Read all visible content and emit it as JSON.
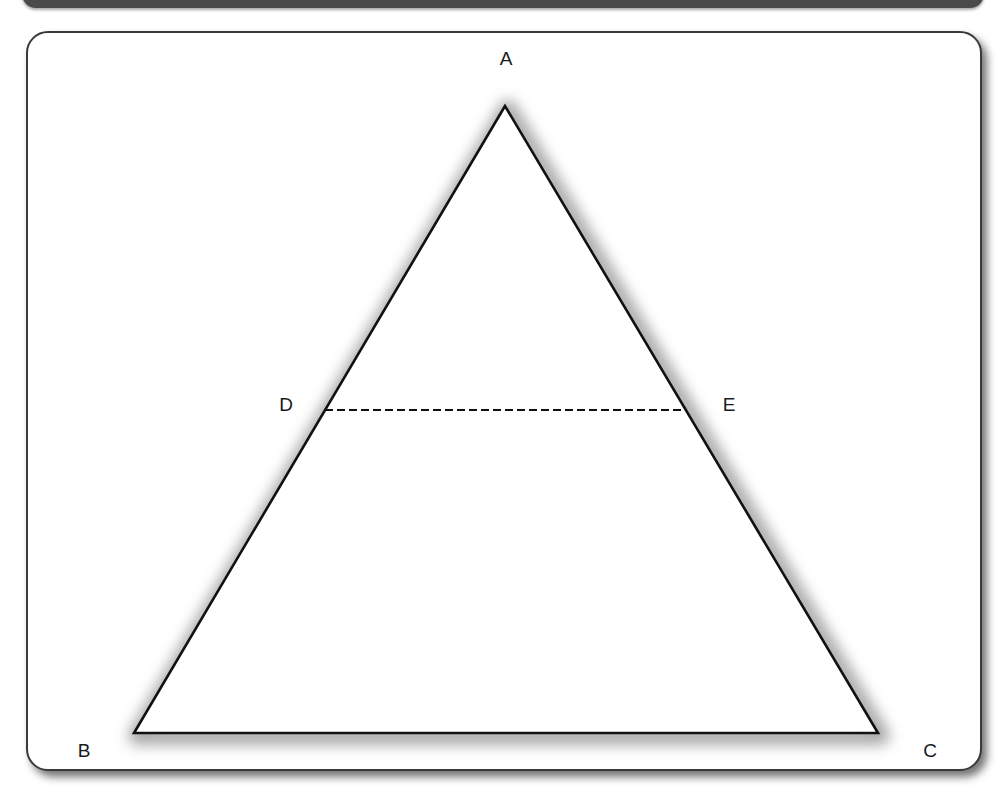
{
  "figure": {
    "type": "triangle-with-midsegment",
    "colors": {
      "stroke": "#111111",
      "shadow": "#9a9a9a",
      "frame_border": "#3a3a3a",
      "top_bar": "#4a4a4a"
    },
    "points": {
      "A": {
        "label": "A",
        "x": 505,
        "y": 106,
        "label_x": 506,
        "label_y": 65
      },
      "B": {
        "label": "B",
        "x": 134,
        "y": 733,
        "label_x": 84,
        "label_y": 757
      },
      "C": {
        "label": "C",
        "x": 878,
        "y": 733,
        "label_x": 930,
        "label_y": 757
      },
      "D": {
        "label": "D",
        "x": 325,
        "y": 410,
        "label_x": 286,
        "label_y": 411
      },
      "E": {
        "label": "E",
        "x": 687,
        "y": 410,
        "label_x": 729,
        "label_y": 411
      }
    },
    "segments": [
      {
        "from": "A",
        "to": "B",
        "style": "solid"
      },
      {
        "from": "B",
        "to": "C",
        "style": "solid"
      },
      {
        "from": "C",
        "to": "A",
        "style": "solid"
      },
      {
        "from": "D",
        "to": "E",
        "style": "dashed"
      }
    ]
  }
}
